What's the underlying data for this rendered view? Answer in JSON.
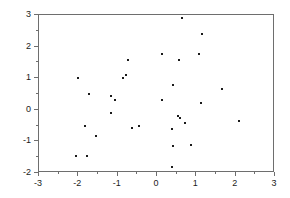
{
  "chart_data": {
    "type": "scatter",
    "title": "",
    "xlabel": "",
    "ylabel": "",
    "xlim": [
      -3,
      3
    ],
    "ylim": [
      -2,
      3
    ],
    "xticks": [
      -3,
      -2,
      -1,
      0,
      1,
      2,
      3
    ],
    "yticks": [
      -2,
      -1,
      0,
      1,
      2,
      3
    ],
    "xtick_labels": [
      "-3",
      "-2",
      "-1",
      "0",
      "1",
      "2",
      "3"
    ],
    "ytick_labels": [
      "-2",
      "-1",
      "0",
      "1",
      "2",
      "3"
    ],
    "xminor_ticks": [
      -2.5,
      -1.5,
      -0.5,
      0.5,
      1.5,
      2.5
    ],
    "yminor_ticks": [
      -1.5,
      -0.5,
      0.5,
      1.5,
      2.5
    ],
    "grid": false,
    "legend": null,
    "marker": "square",
    "marker_color": "#1a1a1a",
    "marker_size_px": 2,
    "frame_color": "#6e6e6e",
    "background_color": "#ffffff",
    "n_points": 36,
    "series": [
      {
        "name": "observations",
        "points": [
          [
            -2.0,
            1.0
          ],
          [
            -1.74,
            0.49
          ],
          [
            -1.82,
            -0.5
          ],
          [
            -1.56,
            -0.82
          ],
          [
            -2.05,
            -1.47
          ],
          [
            -1.77,
            -1.47
          ],
          [
            -1.18,
            0.44
          ],
          [
            -1.08,
            0.32
          ],
          [
            -1.18,
            -0.09
          ],
          [
            -0.87,
            1.02
          ],
          [
            -0.79,
            1.09
          ],
          [
            -0.74,
            1.58
          ],
          [
            -0.64,
            -0.57
          ],
          [
            -0.46,
            -0.5
          ],
          [
            0.13,
            1.77
          ],
          [
            0.13,
            0.3
          ],
          [
            0.41,
            0.78
          ],
          [
            0.38,
            -0.6
          ],
          [
            0.41,
            -1.13
          ],
          [
            0.38,
            -1.82
          ],
          [
            0.56,
            1.58
          ],
          [
            0.54,
            -0.19
          ],
          [
            0.59,
            -0.27
          ],
          [
            0.64,
            2.89
          ],
          [
            0.72,
            -0.42
          ],
          [
            0.87,
            -1.12
          ],
          [
            1.08,
            1.77
          ],
          [
            1.15,
            2.39
          ],
          [
            1.13,
            0.2
          ],
          [
            1.64,
            0.66
          ],
          [
            2.08,
            -0.34
          ]
        ]
      }
    ]
  }
}
